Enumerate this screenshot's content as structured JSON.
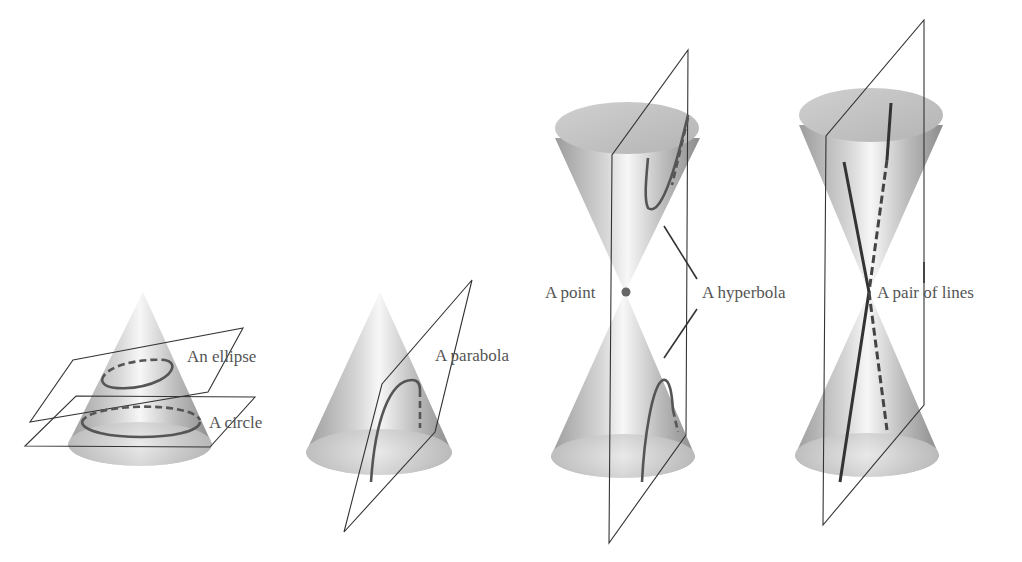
{
  "figure": {
    "panels": [
      {
        "id": "ellipse-circle",
        "labels": [
          "An ellipse",
          "A circle"
        ]
      },
      {
        "id": "parabola",
        "labels": [
          "A parabola"
        ]
      },
      {
        "id": "hyperbola-point",
        "labels": [
          "A point",
          "A hyperbola"
        ]
      },
      {
        "id": "pair-of-lines",
        "labels": [
          "A pair of lines"
        ]
      }
    ]
  },
  "labels": {
    "ellipse": "An ellipse",
    "circle": "A circle",
    "parabola": "A parabola",
    "point": "A point",
    "hyperbola": "A hyperbola",
    "pair_of_lines": "A pair of lines"
  },
  "colors": {
    "cone_light": "#f2f2f2",
    "cone_dark": "#9a9a9a",
    "curve": "#555555",
    "plane_edge": "#333333",
    "text": "#555555"
  }
}
